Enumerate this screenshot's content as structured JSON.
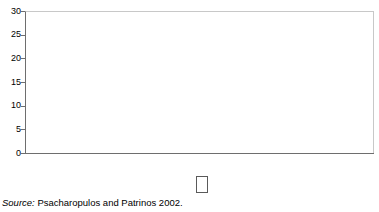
{
  "chart_data": {
    "type": "bar",
    "title": "",
    "subtitle": "",
    "xlabel": "",
    "ylabel": "",
    "ylim": [
      0,
      30
    ],
    "yticks": [
      0,
      5,
      10,
      15,
      20,
      25,
      30
    ],
    "ytick_labels": [
      "0",
      "5",
      "10",
      "15",
      "20",
      "25",
      "30"
    ],
    "grid": false,
    "legend_position": "bottom-right",
    "categories": [
      "Low income",
      "Middle income",
      "High income",
      "Overall"
    ],
    "series": [
      {
        "name": "Primary",
        "color": "#1a1a1a",
        "values": [
          25.7,
          27.2,
          null,
          26.0
        ]
      },
      {
        "name": "Secondary",
        "color": "#c2c2c2",
        "values": [
          19.9,
          17.8,
          11.8,
          16.6
        ]
      },
      {
        "name": "Higher",
        "color": "#ebebeb",
        "values": [
          25.8,
          19.2,
          11.9,
          18.4
        ]
      }
    ],
    "annotations": [
      "Source: Psacharopulos and Patrinos 2002."
    ]
  },
  "axis": {
    "y_ticks": [
      "0",
      "5",
      "10",
      "15",
      "20",
      "25",
      "30"
    ]
  },
  "categories": [
    {
      "label": "Low income"
    },
    {
      "label": "Middle income"
    },
    {
      "label": "High income"
    },
    {
      "label": "Overall"
    }
  ],
  "legend": {
    "items": [
      {
        "label": "Primary",
        "swatch": "legend-swatch-primary"
      },
      {
        "label": "Secondary",
        "swatch": "legend-swatch-secondary"
      },
      {
        "label": "Higher",
        "swatch": "legend-swatch-higher"
      }
    ]
  },
  "source": {
    "prefix": "Source:",
    "text": "Psacharopulos and Patrinos 2002."
  }
}
